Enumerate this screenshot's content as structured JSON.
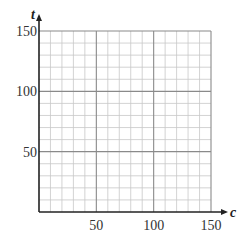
{
  "chart_data": {
    "type": "line",
    "title": "",
    "xlabel": "c",
    "ylabel": "t",
    "xlim": [
      0,
      150
    ],
    "ylim": [
      0,
      150
    ],
    "x_ticks": [
      50,
      100,
      150
    ],
    "y_ticks": [
      50,
      100,
      150
    ],
    "x_tick_labels": [
      "50",
      "100",
      "150"
    ],
    "y_tick_labels": [
      "50",
      "100",
      "150"
    ],
    "grid": true,
    "minor_grid_step": 10,
    "major_grid_step": 50,
    "series": [],
    "legend": null
  },
  "colors": {
    "minor_grid": "#c8c8c8",
    "major_grid": "#8a8a8a",
    "axis": "#222222",
    "background": "#ffffff"
  }
}
